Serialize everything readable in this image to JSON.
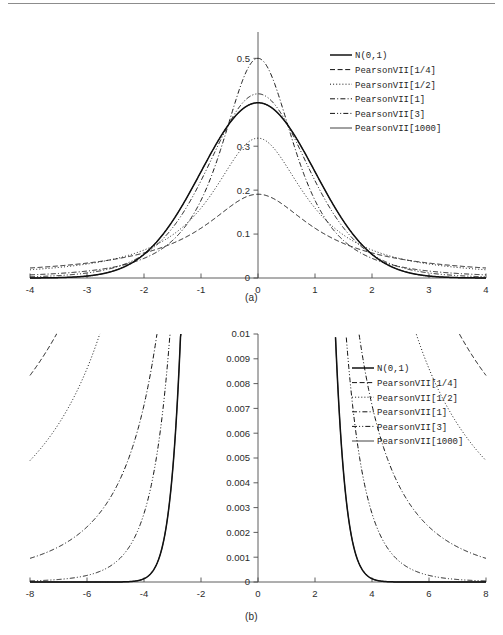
{
  "figure": {
    "panels": [
      {
        "id": "a",
        "caption": "(a)"
      },
      {
        "id": "b",
        "caption": "(b)"
      }
    ]
  },
  "chart_data": [
    {
      "id": "panel-a",
      "type": "line",
      "title": "",
      "subtitle": "",
      "caption": "(a)",
      "xlabel": "",
      "ylabel": "",
      "xlim": [
        -4,
        4
      ],
      "ylim": [
        0,
        0.56
      ],
      "xticks": [
        -4,
        -3,
        -2,
        -1,
        0,
        1,
        2,
        3,
        4
      ],
      "xticklabels": [
        "-4",
        "-3",
        "-2",
        "-1",
        "0",
        "1",
        "2",
        "3",
        "4"
      ],
      "yticks": [
        0,
        0.1,
        0.2,
        0.3,
        0.5
      ],
      "yticklabels": [
        "0",
        "0.1",
        "0.2",
        "0.3",
        "0.5"
      ],
      "grid": false,
      "legend_position": "upper-right",
      "axis_style": "spines-cross-at-origin",
      "series": [
        {
          "name": "N(0,1)",
          "kind": "normal",
          "m": null,
          "dash": "none",
          "width": 1.5,
          "peak": 0.3989
        },
        {
          "name": "PearsonVII[1/4]",
          "kind": "pearson7",
          "m": 0.25,
          "dash": "dashed",
          "width": 1.0,
          "peak": 0.5516
        },
        {
          "name": "PearsonVII[1/2]",
          "kind": "pearson7",
          "m": 0.5,
          "dash": "dotted",
          "width": 1.0,
          "peak": 0.4775
        },
        {
          "name": "PearsonVII[1]",
          "kind": "pearson7",
          "m": 1,
          "dash": "dashdot",
          "width": 1.0,
          "peak": 0.4413
        },
        {
          "name": "PearsonVII[3]",
          "kind": "pearson7",
          "m": 3,
          "dash": "dashdotdot",
          "width": 1.0,
          "peak": 0.4119
        },
        {
          "name": "PearsonVII[1000]",
          "kind": "pearson7",
          "m": 1000,
          "dash": "none",
          "width": 0.8,
          "peak": 0.3991
        }
      ]
    },
    {
      "id": "panel-b",
      "type": "line",
      "title": "",
      "subtitle": "",
      "caption": "(b)",
      "xlabel": "",
      "ylabel": "",
      "xlim": [
        -8,
        8
      ],
      "ylim": [
        0,
        0.01
      ],
      "xticks": [
        -8,
        -6,
        -4,
        -2,
        0,
        2,
        4,
        6,
        8
      ],
      "xticklabels": [
        "-8",
        "-6",
        "-4",
        "-2",
        "0",
        "2",
        "4",
        "6",
        "8"
      ],
      "yticks": [
        0,
        0.001,
        0.002,
        0.003,
        0.004,
        0.005,
        0.006,
        0.007,
        0.008,
        0.009,
        0.01
      ],
      "yticklabels": [
        "0",
        "0.001",
        "0.002",
        "0.003",
        "0.004",
        "0.005",
        "0.006",
        "0.007",
        "0.008",
        "0.009",
        "0.01"
      ],
      "grid": false,
      "legend_position": "right",
      "axis_style": "spines-cross-at-origin",
      "note": "tail detail of panel (a); densities clipped at 0.01",
      "series": [
        {
          "name": "N(0,1)",
          "kind": "normal",
          "m": null,
          "dash": "none",
          "width": 1.5
        },
        {
          "name": "PearsonVII[1/4]",
          "kind": "pearson7",
          "m": 0.25,
          "dash": "dashed",
          "width": 1.0
        },
        {
          "name": "PearsonVII[1/2]",
          "kind": "pearson7",
          "m": 0.5,
          "dash": "dotted",
          "width": 1.0
        },
        {
          "name": "PearsonVII[1]",
          "kind": "pearson7",
          "m": 1,
          "dash": "dashdot",
          "width": 1.0
        },
        {
          "name": "PearsonVII[3]",
          "kind": "pearson7",
          "m": 3,
          "dash": "dashdotdot",
          "width": 1.0
        },
        {
          "name": "PearsonVII[1000]",
          "kind": "pearson7",
          "m": 1000,
          "dash": "none",
          "width": 0.8
        }
      ]
    }
  ],
  "legend": {
    "entries": [
      {
        "label": "N(0,1)"
      },
      {
        "label": "PearsonVII[1/4]"
      },
      {
        "label": "PearsonVII[1/2]"
      },
      {
        "label": "PearsonVII[1]"
      },
      {
        "label": "PearsonVII[3]"
      },
      {
        "label": "PearsonVII[1000]"
      }
    ]
  },
  "colors": {
    "curve": "#121212",
    "axis": "#4d4d4d",
    "text": "#2b2b2b",
    "background": "#ffffff"
  }
}
